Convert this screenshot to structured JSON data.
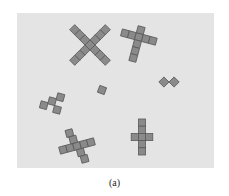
{
  "figure": {
    "caption": "(a)",
    "background_color": "#e4e4e4",
    "tile_color": "#8a8a8a",
    "tile_border_color": "#5a5a5a",
    "shapes": [
      {
        "name": "x-shape-rotated-45",
        "cx": 93,
        "cy": 44
      },
      {
        "name": "cross-shape-tilted",
        "cx": 137,
        "cy": 43
      },
      {
        "name": "domino-diagonal",
        "cx": 169,
        "cy": 82
      },
      {
        "name": "single-tile",
        "cx": 102,
        "cy": 90
      },
      {
        "name": "zigzag-diagonal",
        "cx": 55,
        "cy": 101
      },
      {
        "name": "cross-shape-tilted-lower",
        "cx": 75,
        "cy": 146
      },
      {
        "name": "cross-shape-upright",
        "cx": 142,
        "cy": 137
      }
    ]
  }
}
